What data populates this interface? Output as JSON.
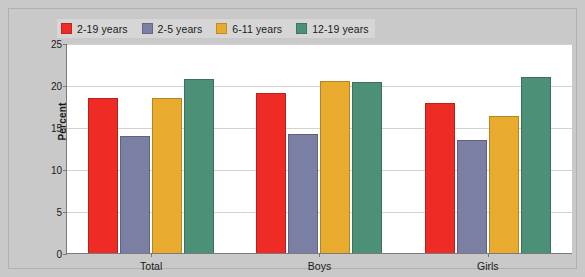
{
  "chart_data": {
    "type": "bar",
    "title": "",
    "xlabel": "",
    "ylabel": "Percent",
    "ylim": [
      0,
      25
    ],
    "yticks": [
      0,
      5,
      10,
      15,
      20,
      25
    ],
    "grid": true,
    "legend_position": "top-left",
    "categories": [
      "Total",
      "Boys",
      "Girls"
    ],
    "series": [
      {
        "name": "2-19 years",
        "color": "#ef2b26",
        "values": [
          18.5,
          19.1,
          17.8
        ]
      },
      {
        "name": "2-5 years",
        "color": "#7b7fa3",
        "values": [
          13.9,
          14.2,
          13.5
        ]
      },
      {
        "name": "6-11 years",
        "color": "#e8ab2e",
        "values": [
          18.5,
          20.5,
          16.3
        ]
      },
      {
        "name": "12-19 years",
        "color": "#4b9077",
        "values": [
          20.7,
          20.3,
          20.9
        ]
      }
    ]
  },
  "colors": {
    "background": "#c9c9c9",
    "plot_background": "#ffffff",
    "axis": "#7a7a7a",
    "gridline": "#d2d2d2",
    "text": "#1a1a1a"
  }
}
